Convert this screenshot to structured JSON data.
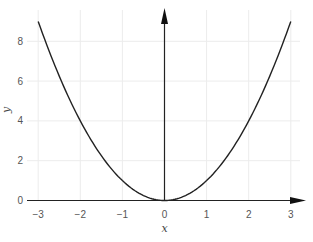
{
  "chart_data": {
    "type": "line",
    "title": "",
    "xlabel": "x",
    "ylabel": "y",
    "xlim": [
      -3,
      3
    ],
    "ylim": [
      0,
      9
    ],
    "grid": true,
    "legend": null,
    "x_ticks": [
      -3,
      -2,
      -1,
      0,
      1,
      2,
      3
    ],
    "y_ticks": [
      0,
      2,
      4,
      6,
      8
    ],
    "x_tick_labels": [
      "−3",
      "−2",
      "−1",
      "0",
      "1",
      "2",
      "3"
    ],
    "y_tick_labels": [
      "0",
      "2",
      "4",
      "6",
      "8"
    ],
    "series": [
      {
        "name": "y = x^2",
        "x": [
          -3,
          -2.5,
          -2,
          -1.5,
          -1,
          -0.5,
          0,
          0.5,
          1,
          1.5,
          2,
          2.5,
          3
        ],
        "y": [
          9,
          6.25,
          4,
          2.25,
          1,
          0.25,
          0,
          0.25,
          1,
          2.25,
          4,
          6.25,
          9
        ],
        "color": "#222222"
      }
    ],
    "axes_style": "arrows through origin"
  },
  "colors": {
    "curve": "#222222",
    "axis": "#222222",
    "grid": "#ececec",
    "tick_text": "#555555"
  }
}
